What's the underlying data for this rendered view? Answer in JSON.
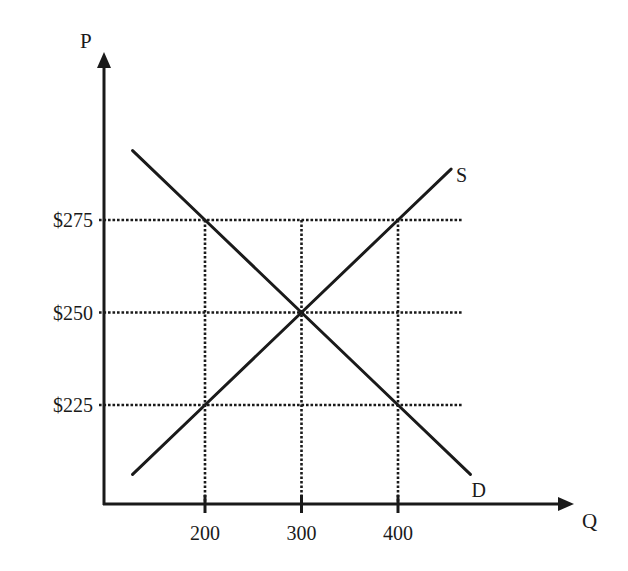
{
  "chart_data": {
    "type": "line",
    "title": "",
    "xlabel": "Q",
    "ylabel": "P",
    "x_ticks": [
      200,
      300,
      400
    ],
    "x_tick_labels": [
      "200",
      "300",
      "400"
    ],
    "y_ticks": [
      225,
      250,
      275
    ],
    "y_tick_labels": [
      "$225",
      "$250",
      "$275"
    ],
    "grid": "dotted reference lines at tick values",
    "legend": "none (curves labeled directly at their ends)",
    "series": [
      {
        "name": "Demand",
        "label": "D",
        "x": [
          125,
          200,
          300,
          400,
          475
        ],
        "y": [
          293.75,
          275,
          250,
          225,
          206.25
        ]
      },
      {
        "name": "Supply",
        "label": "S",
        "x": [
          125,
          200,
          300,
          400,
          455
        ],
        "y": [
          206.25,
          225,
          250,
          275,
          288.75
        ]
      }
    ],
    "equilibrium": {
      "q": 300,
      "p": 250
    },
    "colors": {
      "ink": "#1a1a1a",
      "background": "#ffffff"
    }
  }
}
